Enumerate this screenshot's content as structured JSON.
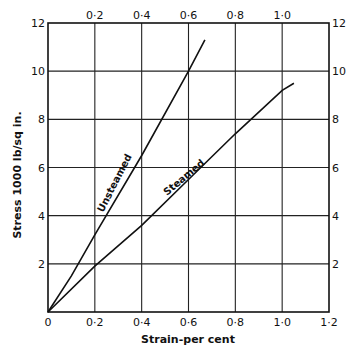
{
  "chart_data": {
    "type": "line",
    "title": "",
    "xlabel": "Strain-per cent",
    "ylabel": "Stress 1000 lb/sq in.",
    "xlim": [
      0,
      1.2
    ],
    "ylim": [
      0,
      12
    ],
    "grid": true,
    "x_ticks_bottom": [
      "0",
      "0·2",
      "0·4",
      "0·6",
      "0·8",
      "1·0",
      "1·2"
    ],
    "x_ticks_top": [
      "0·2",
      "0·4",
      "0·6",
      "0·8",
      "1·0"
    ],
    "y_ticks_left": [
      "0",
      "2",
      "4",
      "6",
      "8",
      "10",
      "12"
    ],
    "y_ticks_right": [
      "2",
      "4",
      "6",
      "8",
      "10",
      "12"
    ],
    "series": [
      {
        "name": "Unsteamed",
        "x": [
          0,
          0.1,
          0.2,
          0.4,
          0.6,
          0.67
        ],
        "y": [
          0,
          1.5,
          3.2,
          6.5,
          10.0,
          11.3
        ]
      },
      {
        "name": "Steamed",
        "x": [
          0,
          0.2,
          0.4,
          0.6,
          0.8,
          1.0,
          1.05
        ],
        "y": [
          0,
          1.9,
          3.6,
          5.5,
          7.4,
          9.2,
          9.5
        ]
      }
    ],
    "legend": "inline labels along curves"
  },
  "labels": {
    "xlabel": "Strain-per cent",
    "ylabel": "Stress 1000 lb/sq in.",
    "unsteamed": "Unsteamed",
    "steamed": "Steamed"
  },
  "style": {
    "line_color": "#111111",
    "grid_color": "#222222",
    "background": "#ffffff"
  }
}
